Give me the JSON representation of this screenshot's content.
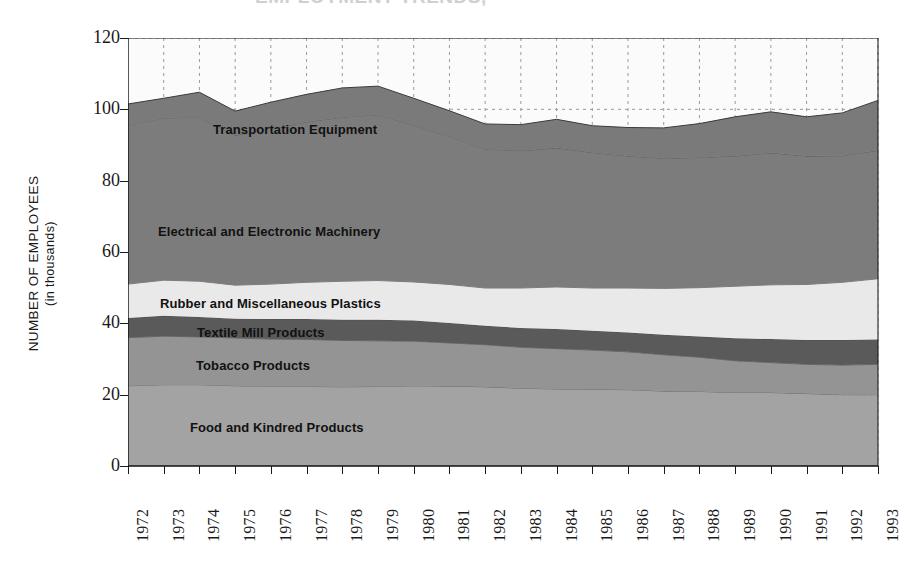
{
  "figure": {
    "cropped_title": "EMPLOYMENT TRENDS, ",
    "ylabel_line1": "NUMBER OF EMPLOYEES",
    "ylabel_line2": "(in thousands)"
  },
  "chart_data": {
    "type": "area",
    "stacked": true,
    "title": "",
    "xlabel": "",
    "ylabel": "NUMBER OF EMPLOYEES (in thousands)",
    "ylim": [
      0,
      120
    ],
    "yticks": [
      0,
      20,
      40,
      60,
      80,
      100,
      120
    ],
    "grid": "dashed vertical and horizontal",
    "legend_position": "inline-labels",
    "categories": [
      "1972",
      "1973",
      "1974",
      "1975",
      "1976",
      "1977",
      "1978",
      "1979",
      "1980",
      "1981",
      "1982",
      "1983",
      "1984",
      "1985",
      "1986",
      "1987",
      "1988",
      "1989",
      "1990",
      "1991",
      "1992",
      "1993"
    ],
    "series": [
      {
        "name": "Food and Kindred Products",
        "color": "#a3a3a3",
        "values": [
          22.5,
          22.8,
          22.8,
          22.5,
          22.3,
          22.3,
          22.2,
          22.3,
          22.5,
          22.4,
          22.2,
          21.8,
          21.6,
          21.5,
          21.4,
          21.0,
          20.9,
          20.6,
          20.6,
          20.3,
          20.0,
          20.0
        ]
      },
      {
        "name": "Tobacco Products",
        "color": "#949494",
        "values": [
          13.5,
          13.6,
          13.4,
          13.4,
          13.3,
          13.2,
          13.0,
          12.8,
          12.5,
          12.1,
          11.8,
          11.5,
          11.3,
          11.0,
          10.6,
          10.2,
          9.6,
          8.9,
          8.4,
          8.2,
          8.3,
          8.5
        ]
      },
      {
        "name": "Textile Mill Products",
        "color": "#5a5a5a",
        "values": [
          5.5,
          5.7,
          5.6,
          5.4,
          5.6,
          5.7,
          5.8,
          5.9,
          5.8,
          5.6,
          5.3,
          5.4,
          5.5,
          5.4,
          5.4,
          5.6,
          5.8,
          6.3,
          6.6,
          6.8,
          7.0,
          7.0
        ]
      },
      {
        "name": "Rubber and Miscellaneous Plastics",
        "color": "#e9e9e9",
        "values": [
          9.5,
          10.0,
          10.0,
          9.4,
          9.8,
          10.3,
          10.8,
          11.0,
          10.8,
          10.8,
          10.6,
          11.2,
          11.8,
          12.0,
          12.5,
          13.0,
          13.7,
          14.6,
          15.2,
          15.6,
          16.2,
          17.0
        ]
      },
      {
        "name": "Electrical and Electronic Machinery",
        "color": "#7c7c7c",
        "values": [
          44.5,
          45.5,
          46.0,
          42.0,
          43.5,
          45.0,
          46.0,
          46.5,
          44.0,
          41.5,
          39.0,
          38.5,
          39.0,
          38.0,
          37.0,
          36.5,
          36.5,
          36.5,
          37.0,
          36.0,
          35.5,
          36.0
        ]
      },
      {
        "name": "Transportation Equipment",
        "color": "#7a7a7a",
        "values": [
          6.0,
          5.5,
          7.0,
          6.8,
          7.5,
          7.7,
          8.2,
          8.0,
          7.5,
          7.2,
          7.0,
          7.3,
          8.0,
          7.5,
          8.0,
          8.5,
          9.5,
          11.0,
          11.5,
          11.0,
          12.0,
          14.0
        ]
      }
    ],
    "totals": [
      101.5,
      103.1,
      104.8,
      99.5,
      102.0,
      104.2,
      106.0,
      106.5,
      103.1,
      99.6,
      95.9,
      95.7,
      97.2,
      95.4,
      94.9,
      94.8,
      96.0,
      98.9,
      99.3,
      97.9,
      99.0,
      102.5
    ],
    "series_inline_labels": [
      {
        "text": "Transportation Equipment",
        "x": 213,
        "y": 122
      },
      {
        "text": "Electrical and Electronic Machinery",
        "x": 158,
        "y": 224
      },
      {
        "text": "Rubber and Miscellaneous Plastics",
        "x": 160,
        "y": 296
      },
      {
        "text": "Textile Mill Products",
        "x": 197,
        "y": 325
      },
      {
        "text": "Tobacco Products",
        "x": 196,
        "y": 358
      },
      {
        "text": "Food and Kindred Products",
        "x": 190,
        "y": 420
      }
    ]
  }
}
